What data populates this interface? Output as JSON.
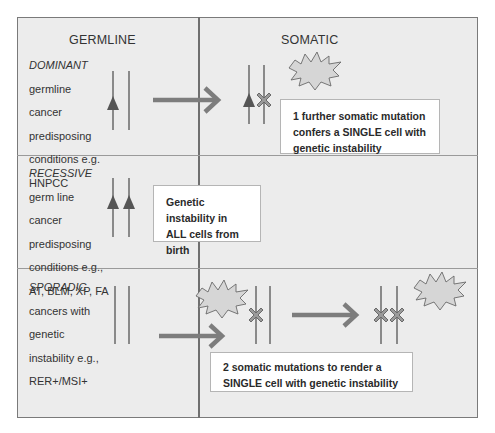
{
  "columns": {
    "germline": "GERMLINE",
    "somatic": "SOMATIC"
  },
  "rows": [
    {
      "category": "DOMINANT",
      "description_lines": [
        "germline",
        "cancer",
        "predisposing",
        "conditions e.g.",
        "HNPCC"
      ],
      "note": "1 further somatic mutation confers a SINGLE cell with genetic instability"
    },
    {
      "category": "RECESSIVE",
      "description_lines": [
        "germ line",
        "cancer",
        "predisposing",
        "conditions e.g.,",
        "AT, BLM, XP, FA"
      ],
      "note": "Genetic instability in ALL cells from birth"
    },
    {
      "category": "SPORADIC",
      "description_lines": [
        "cancers  with",
        "genetic",
        "instability e.g.,",
        "RER+/MSI+"
      ],
      "note": "2 somatic mutations  to render a SINGLE cell with genetic instability"
    }
  ],
  "colors": {
    "background": "#ececec",
    "border": "#7a7a7a",
    "chromosome": "#8a8a8a",
    "mutation": "#555555",
    "arrow": "#7d7d7d"
  }
}
